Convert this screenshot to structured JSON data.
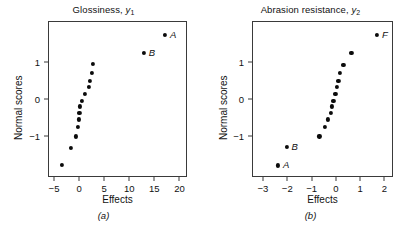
{
  "figure": {
    "background": "#ffffff",
    "marker_color": "#0b0b0b",
    "axis_color": "#3a3a3a"
  },
  "panels": [
    {
      "id": "a",
      "subcaption": "(a)",
      "title_main": "Glossiness,",
      "title_var": "y",
      "title_sub": "1",
      "xlabel": "Effects",
      "ylabel": "Normal scores",
      "xticks": [
        "-5",
        "0",
        "5",
        "10",
        "15",
        "20"
      ],
      "yticks": [
        "1",
        "0",
        "-1"
      ]
    },
    {
      "id": "b",
      "subcaption": "(b)",
      "title_main": "Abrasion resistance,",
      "title_var": "y",
      "title_sub": "2",
      "xlabel": "Effects",
      "ylabel": "Normal scores",
      "xticks": [
        "-3",
        "-2",
        "-1",
        "0",
        "1",
        "2"
      ],
      "yticks": [
        "1",
        "0",
        "-1"
      ]
    }
  ],
  "chart_data": [
    {
      "type": "scatter",
      "title": "Glossiness, y1",
      "xlabel": "Effects",
      "ylabel": "Normal scores",
      "xlim": [
        -6.2,
        21.5
      ],
      "ylim": [
        -2.1,
        2.1
      ],
      "xticks": [
        -5,
        0,
        5,
        10,
        15,
        20
      ],
      "yticks": [
        1,
        0,
        -1
      ],
      "grid": false,
      "legend": "none",
      "points": [
        {
          "x": -3.7,
          "y": -1.74,
          "label": ""
        },
        {
          "x": -1.8,
          "y": -1.28,
          "label": ""
        },
        {
          "x": -0.9,
          "y": -0.98,
          "label": ""
        },
        {
          "x": -0.4,
          "y": -0.73,
          "label": ""
        },
        {
          "x": -0.2,
          "y": -0.52,
          "label": ""
        },
        {
          "x": -0.15,
          "y": -0.35,
          "label": ""
        },
        {
          "x": -0.1,
          "y": -0.17,
          "label": ""
        },
        {
          "x": 0.3,
          "y": -0.02,
          "label": ""
        },
        {
          "x": 1.0,
          "y": 0.17,
          "label": ""
        },
        {
          "x": 1.7,
          "y": 0.35,
          "label": ""
        },
        {
          "x": 2.0,
          "y": 0.52,
          "label": ""
        },
        {
          "x": 2.3,
          "y": 0.72,
          "label": ""
        },
        {
          "x": 2.6,
          "y": 0.97,
          "label": ""
        },
        {
          "x": 12.7,
          "y": 1.27,
          "label": "B"
        },
        {
          "x": 16.9,
          "y": 1.76,
          "label": "A"
        }
      ]
    },
    {
      "type": "scatter",
      "title": "Abrasion resistance, y2",
      "xlabel": "Effects",
      "ylabel": "Normal scores",
      "xlim": [
        -3.45,
        2.35
      ],
      "ylim": [
        -2.1,
        2.1
      ],
      "xticks": [
        -3,
        -2,
        -1,
        0,
        1,
        2
      ],
      "yticks": [
        1,
        0,
        -1
      ],
      "grid": false,
      "legend": "none",
      "points": [
        {
          "x": -2.42,
          "y": -1.76,
          "label": "A"
        },
        {
          "x": -2.07,
          "y": -1.27,
          "label": "B"
        },
        {
          "x": -0.72,
          "y": -0.98,
          "label": ""
        },
        {
          "x": -0.5,
          "y": -0.73,
          "label": ""
        },
        {
          "x": -0.38,
          "y": -0.52,
          "label": ""
        },
        {
          "x": -0.26,
          "y": -0.35,
          "label": ""
        },
        {
          "x": -0.21,
          "y": -0.17,
          "label": ""
        },
        {
          "x": -0.14,
          "y": -0.02,
          "label": ""
        },
        {
          "x": -0.06,
          "y": 0.17,
          "label": ""
        },
        {
          "x": 0.0,
          "y": 0.35,
          "label": ""
        },
        {
          "x": 0.06,
          "y": 0.52,
          "label": ""
        },
        {
          "x": 0.13,
          "y": 0.72,
          "label": ""
        },
        {
          "x": 0.27,
          "y": 0.95,
          "label": ""
        },
        {
          "x": 0.6,
          "y": 1.27,
          "label": ""
        },
        {
          "x": 1.65,
          "y": 1.76,
          "label": "F"
        }
      ]
    }
  ]
}
